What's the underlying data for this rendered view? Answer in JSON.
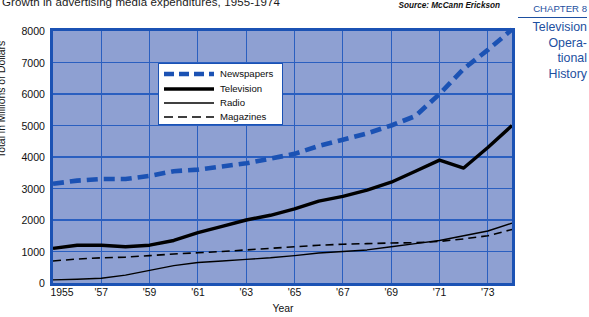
{
  "caption": "Growth in advertising media expenditures, 1955-1974",
  "source_note": "Source: McCann Erickson",
  "sidebar": {
    "chapter": "CHAPTER 8",
    "lines": [
      "Television",
      "Opera-",
      "tional",
      "History"
    ],
    "accent_color": "#1d4fa0"
  },
  "colors": {
    "plot_background": "#8ea0d2",
    "plot_border": "#1b52b4",
    "gridline": "#2a5fc0",
    "newspapers": "#1b52b4",
    "television": "#000000",
    "radio": "#000000",
    "magazines": "#000000",
    "legend_background": "#ffffff"
  },
  "legend": {
    "items": [
      {
        "label": "Newspapers",
        "style": "thick-dashed",
        "color": "#1b52b4"
      },
      {
        "label": "Television",
        "style": "thick-solid",
        "color": "#000000"
      },
      {
        "label": "Radio",
        "style": "thin-solid",
        "color": "#000000"
      },
      {
        "label": "Magazines",
        "style": "thin-dashed",
        "color": "#000000"
      }
    ]
  },
  "chart_data": {
    "type": "line",
    "title": "Growth in advertising media expenditures, 1955-1974",
    "xlabel": "Year",
    "ylabel": "Total in Millions of Dollars",
    "xlim": [
      1955,
      1974
    ],
    "ylim": [
      0,
      8000
    ],
    "grid": true,
    "legend_position": "upper-left-inside",
    "ytick_values": [
      0,
      1000,
      2000,
      3000,
      4000,
      5000,
      6000,
      7000,
      8000
    ],
    "ytick_labels": [
      "0",
      "1000",
      "2000",
      "3000",
      "4000",
      "5000",
      "6000",
      "7000",
      "8000"
    ],
    "xtick_values": [
      1955,
      1957,
      1959,
      1961,
      1963,
      1965,
      1967,
      1969,
      1971,
      1973
    ],
    "xtick_labels": [
      "1955",
      "'57",
      "'59",
      "'61",
      "'63",
      "'65",
      "'67",
      "'69",
      "'71",
      "'73"
    ],
    "x": [
      1955,
      1956,
      1957,
      1958,
      1959,
      1960,
      1961,
      1962,
      1963,
      1964,
      1965,
      1966,
      1967,
      1968,
      1969,
      1970,
      1971,
      1972,
      1973,
      1974
    ],
    "series": [
      {
        "name": "Newspapers",
        "color": "#1b52b4",
        "style": "thick-dashed",
        "values": [
          3150,
          3250,
          3300,
          3300,
          3400,
          3550,
          3600,
          3700,
          3800,
          3950,
          4100,
          4350,
          4550,
          4750,
          5000,
          5300,
          6000,
          6800,
          7400,
          8050
        ]
      },
      {
        "name": "Television",
        "color": "#000000",
        "style": "thick-solid",
        "values": [
          1100,
          1200,
          1200,
          1150,
          1200,
          1350,
          1600,
          1800,
          2000,
          2150,
          2350,
          2600,
          2750,
          2950,
          3200,
          3550,
          3900,
          3650,
          4300,
          5000
        ]
      },
      {
        "name": "Radio",
        "color": "#000000",
        "style": "thin-solid",
        "values": [
          100,
          120,
          150,
          250,
          400,
          550,
          650,
          700,
          750,
          800,
          870,
          950,
          1000,
          1050,
          1150,
          1250,
          1350,
          1500,
          1650,
          1900
        ]
      },
      {
        "name": "Magazines",
        "color": "#000000",
        "style": "thin-dashed",
        "values": [
          700,
          760,
          800,
          820,
          870,
          920,
          960,
          1000,
          1050,
          1100,
          1150,
          1200,
          1230,
          1250,
          1270,
          1280,
          1320,
          1400,
          1500,
          1700
        ]
      }
    ]
  }
}
